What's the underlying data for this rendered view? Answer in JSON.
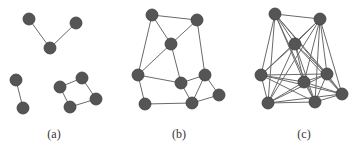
{
  "figure": {
    "panels": [
      {
        "label": "(a)",
        "label_x": 54,
        "nodes": [
          [
            29,
            19
          ],
          [
            76,
            23
          ],
          [
            50,
            48
          ],
          [
            16,
            80
          ],
          [
            23,
            108
          ],
          [
            60,
            87
          ],
          [
            82,
            78
          ],
          [
            96,
            99
          ],
          [
            70,
            107
          ]
        ],
        "edges": [
          [
            0,
            2
          ],
          [
            1,
            2
          ],
          [
            3,
            4
          ],
          [
            5,
            6
          ],
          [
            6,
            7
          ],
          [
            7,
            8
          ],
          [
            8,
            5
          ]
        ]
      },
      {
        "label": "(b)",
        "label_x": 179,
        "nodes": [
          [
            152,
            15
          ],
          [
            197,
            20
          ],
          [
            171,
            44
          ],
          [
            138,
            75
          ],
          [
            181,
            83
          ],
          [
            205,
            75
          ],
          [
            219,
            95
          ],
          [
            145,
            104
          ],
          [
            192,
            103
          ]
        ],
        "edges": [
          [
            0,
            1
          ],
          [
            0,
            2
          ],
          [
            0,
            3
          ],
          [
            1,
            2
          ],
          [
            1,
            5
          ],
          [
            2,
            3
          ],
          [
            2,
            4
          ],
          [
            3,
            4
          ],
          [
            3,
            7
          ],
          [
            4,
            5
          ],
          [
            4,
            8
          ],
          [
            5,
            8
          ],
          [
            5,
            6
          ],
          [
            6,
            8
          ],
          [
            7,
            8
          ]
        ]
      },
      {
        "label": "(c)",
        "label_x": 304,
        "nodes": [
          [
            275,
            14
          ],
          [
            320,
            19
          ],
          [
            295,
            44
          ],
          [
            261,
            75
          ],
          [
            304,
            82
          ],
          [
            327,
            74
          ],
          [
            342,
            94
          ],
          [
            268,
            103
          ],
          [
            315,
            102
          ]
        ],
        "complete": true
      }
    ],
    "colors": {
      "node": "#555555",
      "edge": "#6a6a6a",
      "background": "#ffffff"
    }
  }
}
